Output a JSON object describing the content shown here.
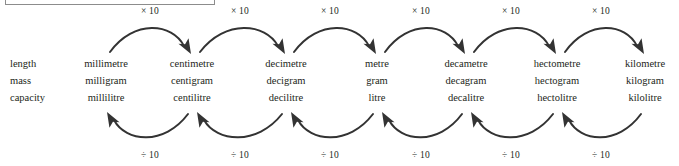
{
  "diagram": {
    "title_box": "",
    "row_labels": [
      "length",
      "mass",
      "capacity"
    ],
    "columns": [
      {
        "prefix": "milli",
        "length": "millimetre",
        "mass": "milligram",
        "capacity": "millilitre",
        "x": 106
      },
      {
        "prefix": "centi",
        "length": "centimetre",
        "mass": "centigram",
        "capacity": "centilitre",
        "x": 192
      },
      {
        "prefix": "deci",
        "length": "decimetre",
        "mass": "decigram",
        "capacity": "decilitre",
        "x": 286
      },
      {
        "prefix": "unit",
        "length": "metre",
        "mass": "gram",
        "capacity": "litre",
        "x": 377
      },
      {
        "prefix": "deca",
        "length": "decametre",
        "mass": "decagram",
        "capacity": "decalitre",
        "x": 466
      },
      {
        "prefix": "hecto",
        "length": "hectometre",
        "mass": "hectogram",
        "capacity": "hectolitre",
        "x": 557
      },
      {
        "prefix": "kilo",
        "length": "kilometre",
        "mass": "kilogram",
        "capacity": "kilolitre",
        "x": 645
      }
    ],
    "multiply_labels": [
      {
        "text": "× 10",
        "x": 150
      },
      {
        "text": "× 10",
        "x": 240
      },
      {
        "text": "× 10",
        "x": 330
      },
      {
        "text": "× 10",
        "x": 421
      },
      {
        "text": "× 10",
        "x": 511
      },
      {
        "text": "× 10",
        "x": 601
      }
    ],
    "divide_labels": [
      {
        "text": "÷ 10",
        "x": 150
      },
      {
        "text": "÷ 10",
        "x": 240
      },
      {
        "text": "÷ 10",
        "x": 330
      },
      {
        "text": "÷ 10",
        "x": 421
      },
      {
        "text": "÷ 10",
        "x": 511
      },
      {
        "text": "÷ 10",
        "x": 601
      }
    ],
    "top_arrows": [
      {
        "from": 106,
        "to": 192,
        "direction": "right",
        "operation": "× 10"
      },
      {
        "from": 196,
        "to": 286,
        "direction": "right",
        "operation": "× 10"
      },
      {
        "from": 290,
        "to": 377,
        "direction": "right",
        "operation": "× 10"
      },
      {
        "from": 381,
        "to": 466,
        "direction": "right",
        "operation": "× 10"
      },
      {
        "from": 470,
        "to": 557,
        "direction": "right",
        "operation": "× 10"
      },
      {
        "from": 561,
        "to": 645,
        "direction": "right",
        "operation": "× 10"
      }
    ],
    "bottom_arrows": [
      {
        "from": 192,
        "to": 106,
        "direction": "left",
        "operation": "÷ 10"
      },
      {
        "from": 286,
        "to": 196,
        "direction": "left",
        "operation": "÷ 10"
      },
      {
        "from": 377,
        "to": 290,
        "direction": "left",
        "operation": "÷ 10"
      },
      {
        "from": 466,
        "to": 381,
        "direction": "left",
        "operation": "÷ 10"
      },
      {
        "from": 557,
        "to": 470,
        "direction": "left",
        "operation": "÷ 10"
      },
      {
        "from": 645,
        "to": 561,
        "direction": "left",
        "operation": "÷ 10"
      }
    ],
    "colors": {
      "text": "#231f20",
      "arrow": "#333333",
      "box_border": "#8c8c8c",
      "background": "#ffffff"
    }
  }
}
